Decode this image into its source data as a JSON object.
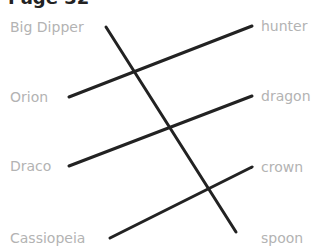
{
  "page": {
    "title": "Page 32"
  },
  "left_items": [
    {
      "label": "Big Dipper"
    },
    {
      "label": "Orion"
    },
    {
      "label": "Draco"
    },
    {
      "label": "Cassiopeia"
    }
  ],
  "right_items": [
    {
      "label": "hunter"
    },
    {
      "label": "dragon"
    },
    {
      "label": "crown"
    },
    {
      "label": "spoon"
    }
  ],
  "connections": [
    {
      "from": "Big Dipper",
      "to": "spoon"
    },
    {
      "from": "Orion",
      "to": "hunter"
    },
    {
      "from": "Draco",
      "to": "dragon"
    },
    {
      "from": "Cassiopeia",
      "to": "crown"
    }
  ],
  "colors": {
    "line": "#222222",
    "label": "#b3b3b3",
    "title": "#222222"
  }
}
